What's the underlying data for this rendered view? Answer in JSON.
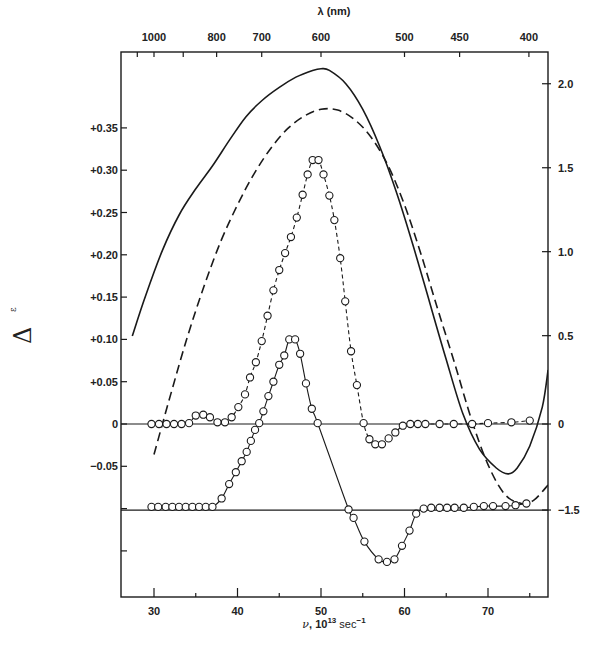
{
  "chart_data": {
    "type": "line",
    "title": "",
    "xlabel": "ν, 10^13 sec^-1",
    "xlabel_parts": {
      "symbol": "ν",
      "text": ", 10",
      "sup1": "13",
      "unit": " sec",
      "sup2": "−1"
    },
    "top_xlabel": "λ (nm)",
    "ylabel": "Δε",
    "ylabel_parts": {
      "delta": "Δ",
      "epsilon": "ε"
    },
    "xlim": [
      26,
      77.2
    ],
    "ylim_left": [
      -0.205,
      0.445
    ],
    "grid": false,
    "legend": null,
    "x_ticks": [
      {
        "value": 30,
        "label": "30"
      },
      {
        "value": 35,
        "label": ""
      },
      {
        "value": 40,
        "label": "40"
      },
      {
        "value": 45,
        "label": ""
      },
      {
        "value": 50,
        "label": "50"
      },
      {
        "value": 55,
        "label": ""
      },
      {
        "value": 60,
        "label": "60"
      },
      {
        "value": 65,
        "label": ""
      },
      {
        "value": 70,
        "label": "70"
      },
      {
        "value": 75,
        "label": ""
      }
    ],
    "top_ticks": [
      {
        "nu": 28.0,
        "label": ""
      },
      {
        "nu": 30.0,
        "label": "1000"
      },
      {
        "nu": 33.5,
        "label": ""
      },
      {
        "nu": 37.5,
        "label": "800"
      },
      {
        "nu": 42.9,
        "label": "700"
      },
      {
        "nu": 50.0,
        "label": "600"
      },
      {
        "nu": 60.0,
        "label": "500"
      },
      {
        "nu": 66.6,
        "label": "450"
      },
      {
        "nu": 74.9,
        "label": "400"
      }
    ],
    "left_ticks": [
      {
        "value": 0.35,
        "label": "+0.35"
      },
      {
        "value": 0.3,
        "label": "+0.30"
      },
      {
        "value": 0.25,
        "label": "+0.25"
      },
      {
        "value": 0.2,
        "label": "+0.20"
      },
      {
        "value": 0.15,
        "label": "+0.15"
      },
      {
        "value": 0.1,
        "label": "+0.10"
      },
      {
        "value": 0.05,
        "label": "+0.05"
      },
      {
        "value": 0.0,
        "label": "0"
      },
      {
        "value": -0.05,
        "label": "−0.05"
      },
      {
        "value": -0.1,
        "label": ""
      },
      {
        "value": -0.15,
        "label": ""
      }
    ],
    "right_ticks": [
      {
        "left_equiv": 0.4022,
        "label": "2.0"
      },
      {
        "left_equiv": 0.3029,
        "label": "1.5"
      },
      {
        "left_equiv": 0.2037,
        "label": "1.0"
      },
      {
        "left_equiv": 0.1044,
        "label": "0.5"
      },
      {
        "left_equiv": 0.0,
        "label": "0"
      },
      {
        "left_equiv": -0.1017,
        "label": "−1.5"
      }
    ],
    "baselines": [
      {
        "name": "upper-baseline",
        "y": 0.0
      },
      {
        "name": "lower-baseline",
        "y": -0.1017
      }
    ],
    "series": [
      {
        "name": "solid-broad-band",
        "style": "solid",
        "markers": false,
        "axis": "right",
        "x": [
          27.4,
          29.0,
          31.0,
          33.0,
          35.0,
          37.0,
          39.0,
          41.0,
          43.0,
          45.0,
          47.0,
          49.0,
          50.0,
          51.0,
          53.0,
          55.0,
          57.0,
          59.0,
          61.0,
          63.0,
          65.0,
          67.0,
          69.0,
          71.0,
          72.4,
          73.5,
          75.0,
          76.5,
          77.2
        ],
        "y": [
          0.104,
          0.152,
          0.205,
          0.247,
          0.278,
          0.305,
          0.335,
          0.363,
          0.383,
          0.398,
          0.41,
          0.418,
          0.42,
          0.418,
          0.402,
          0.372,
          0.329,
          0.275,
          0.212,
          0.144,
          0.076,
          0.012,
          -0.03,
          -0.052,
          -0.059,
          -0.052,
          -0.026,
          0.02,
          0.064
        ]
      },
      {
        "name": "dashed-broad-band",
        "style": "dashed",
        "markers": false,
        "axis": "right",
        "x": [
          30.0,
          32.0,
          34.0,
          36.0,
          38.0,
          40.0,
          42.0,
          44.0,
          46.0,
          48.0,
          50.0,
          52.0,
          54.0,
          56.0,
          58.0,
          60.0,
          62.0,
          64.0,
          66.0,
          68.0,
          70.0,
          72.0,
          74.0,
          75.5,
          77.2
        ],
        "y": [
          -0.036,
          0.035,
          0.103,
          0.163,
          0.216,
          0.259,
          0.296,
          0.326,
          0.349,
          0.364,
          0.372,
          0.371,
          0.36,
          0.339,
          0.306,
          0.259,
          0.2,
          0.135,
          0.072,
          0.006,
          -0.048,
          -0.083,
          -0.094,
          -0.09,
          -0.072
        ]
      },
      {
        "name": "dashed-circles-band",
        "style": "dashed",
        "markers": true,
        "axis": "left",
        "x": [
          29.7,
          30.6,
          31.5,
          32.4,
          33.3,
          34.2,
          35.0,
          35.9,
          36.7,
          37.6,
          38.5,
          39.3,
          40.1,
          40.9,
          41.5,
          42.2,
          42.9,
          43.6,
          44.3,
          45.0,
          45.7,
          46.4,
          47.1,
          47.8,
          48.4,
          49.0,
          49.7,
          50.3,
          51.0,
          51.6,
          52.3,
          52.9,
          53.6,
          54.3,
          55.1,
          55.8,
          56.5,
          57.3,
          58.1,
          58.9,
          59.8,
          60.7,
          61.6,
          62.5,
          64.2,
          65.9,
          68.1,
          70.0,
          72.8,
          75.0
        ],
        "y": [
          0.0,
          0.0,
          0.0,
          0.0,
          0.0,
          0.001,
          0.01,
          0.011,
          0.008,
          0.002,
          0.002,
          0.008,
          0.02,
          0.035,
          0.055,
          0.073,
          0.098,
          0.128,
          0.158,
          0.182,
          0.202,
          0.221,
          0.244,
          0.271,
          0.295,
          0.312,
          0.312,
          0.295,
          0.27,
          0.241,
          0.196,
          0.145,
          0.086,
          0.046,
          0.001,
          -0.018,
          -0.024,
          -0.024,
          -0.017,
          -0.01,
          -0.002,
          0.0,
          0.0,
          0.0,
          0.0,
          0.0,
          0.0,
          0.001,
          0.002,
          0.004
        ]
      },
      {
        "name": "solid-circles-band",
        "style": "solid",
        "markers": true,
        "axis": "left",
        "x": [
          29.7,
          30.5,
          31.4,
          32.2,
          33.0,
          33.8,
          34.6,
          35.4,
          36.2,
          37.0,
          38.1,
          39.0,
          39.8,
          40.5,
          41.1,
          41.6,
          42.1,
          42.6,
          43.1,
          43.7,
          44.3,
          45.0,
          45.6,
          46.2,
          46.9,
          47.5,
          48.2,
          48.9,
          49.6,
          53.3,
          53.9,
          55.2,
          56.9,
          57.9,
          58.8,
          59.7,
          60.6,
          61.4,
          62.3,
          63.2,
          64.2,
          65.1,
          66.0,
          67.1,
          68.3,
          69.5,
          70.6,
          72.1,
          73.3,
          74.6
        ],
        "y": [
          -0.098,
          -0.098,
          -0.098,
          -0.098,
          -0.098,
          -0.098,
          -0.098,
          -0.098,
          -0.098,
          -0.098,
          -0.088,
          -0.071,
          -0.057,
          -0.044,
          -0.033,
          -0.02,
          -0.007,
          0.001,
          0.015,
          0.033,
          0.05,
          0.07,
          0.081,
          0.1,
          0.1,
          0.083,
          0.048,
          0.018,
          0.001,
          -0.101,
          -0.111,
          -0.139,
          -0.16,
          -0.163,
          -0.16,
          -0.144,
          -0.126,
          -0.106,
          -0.1,
          -0.099,
          -0.099,
          -0.099,
          -0.099,
          -0.099,
          -0.098,
          -0.097,
          -0.097,
          -0.097,
          -0.096,
          -0.094
        ]
      }
    ]
  }
}
